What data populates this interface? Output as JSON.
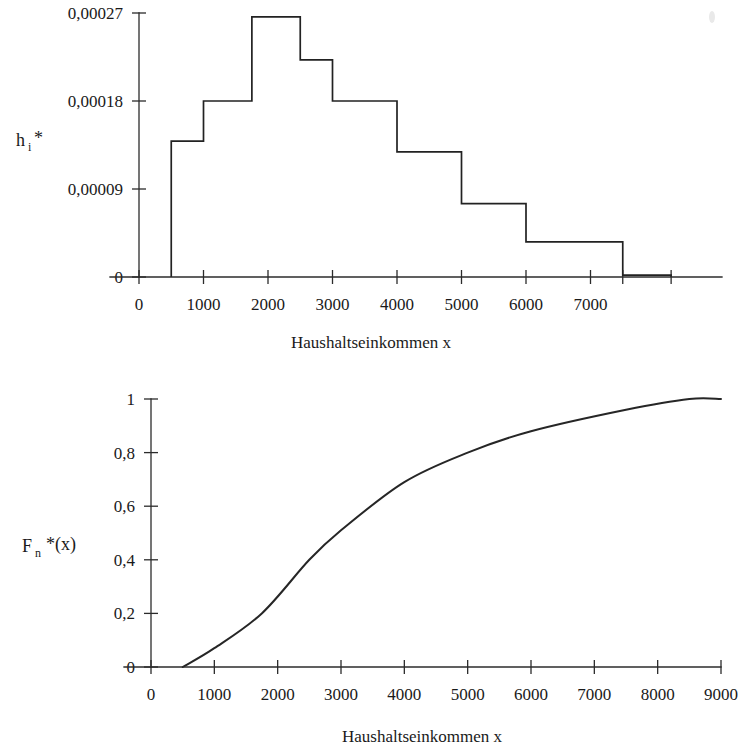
{
  "figure": {
    "background_color": "#ffffff",
    "ink_color": "#1f1f1f",
    "language": "de"
  },
  "chart_data": [
    {
      "id": "histogram",
      "type": "bar",
      "title": "",
      "subtitle": "",
      "xlabel": "Haushaltseinkommen x",
      "ylabel": "h i *",
      "ylabel_base": "h",
      "ylabel_sub": "i",
      "ylabel_star": "*",
      "xlim": [
        0,
        8250
      ],
      "ylim": [
        0,
        0.00027
      ],
      "grid": false,
      "legend": null,
      "x_tick_labels": [
        "0",
        "1000",
        "2000",
        "3000",
        "4000",
        "5000",
        "6000",
        "7000"
      ],
      "x_tick_values": [
        0,
        1000,
        2000,
        3000,
        4000,
        5000,
        6000,
        7000
      ],
      "y_tick_labels": [
        "0",
        "0,00009",
        "0,00018",
        "0,00027"
      ],
      "y_tick_values": [
        0,
        9e-05,
        0.00018,
        0.00027
      ],
      "bin_edges": [
        500,
        1000,
        1750,
        2500,
        3000,
        4000,
        5000,
        6000,
        7500,
        8250
      ],
      "values": [
        0.000139,
        0.00018,
        0.000266,
        0.000222,
        0.00018,
        0.000128,
        7.5e-05,
        3.6e-05,
        2e-06
      ],
      "bin_labels": [
        "500–1000",
        "1000–1750",
        "1750–2500",
        "2500–3000",
        "3000–4000",
        "4000–5000",
        "5000–6000",
        "6000–7500",
        "7500–8250"
      ]
    },
    {
      "id": "ogive",
      "type": "line",
      "title": "",
      "subtitle": "",
      "xlabel": "Haushaltseinkommen x",
      "ylabel": "F n *(x)",
      "ylabel_base": "F",
      "ylabel_sub": "n",
      "ylabel_star": "*(x)",
      "xlim": [
        0,
        9000
      ],
      "ylim": [
        0,
        1
      ],
      "grid": false,
      "legend": null,
      "x_tick_labels": [
        "0",
        "1000",
        "2000",
        "3000",
        "4000",
        "5000",
        "6000",
        "7000",
        "8000",
        "9000"
      ],
      "x_tick_values": [
        0,
        1000,
        2000,
        3000,
        4000,
        5000,
        6000,
        7000,
        8000,
        9000
      ],
      "y_tick_labels": [
        "0",
        "0,2",
        "0,4",
        "0,6",
        "0,8",
        "1"
      ],
      "y_tick_values": [
        0,
        0.2,
        0.4,
        0.6,
        0.8,
        1
      ],
      "x": [
        500,
        1000,
        1750,
        2500,
        3000,
        4000,
        5000,
        6000,
        7500,
        8500,
        9000
      ],
      "y": [
        0.0,
        0.07,
        0.2,
        0.4,
        0.51,
        0.69,
        0.8,
        0.88,
        0.96,
        1.0,
        1.0
      ]
    }
  ]
}
